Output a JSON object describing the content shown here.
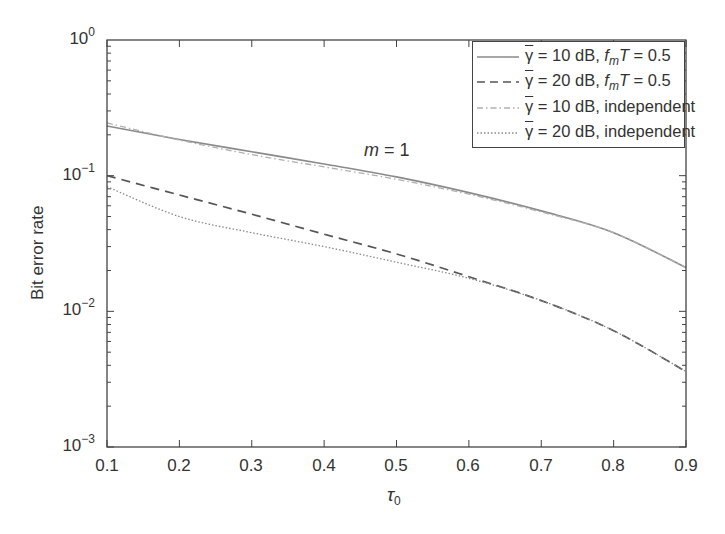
{
  "chart_data": {
    "type": "line",
    "title": "",
    "xlabel": "τ0",
    "ylabel": "Bit error rate",
    "xlim": [
      0.1,
      0.9
    ],
    "ylim": [
      0.001,
      1
    ],
    "yscale": "log",
    "grid": false,
    "legend_position": "upper right",
    "x_ticks": [
      "0.1",
      "0.2",
      "0.3",
      "0.4",
      "0.5",
      "0.6",
      "0.7",
      "0.8",
      "0.9"
    ],
    "y_ticks": [
      {
        "base": "10",
        "exp": "0"
      },
      {
        "base": "10",
        "exp": "−1"
      },
      {
        "base": "10",
        "exp": "−2"
      },
      {
        "base": "10",
        "exp": "−3"
      }
    ],
    "annotation": {
      "text": "m = 1",
      "x": 0.4,
      "y": 0.11
    },
    "x": [
      0.1,
      0.2,
      0.3,
      0.4,
      0.5,
      0.6,
      0.7,
      0.8,
      0.9
    ],
    "series": [
      {
        "name": "γ̄ = 10 dB, fmT = 0.5",
        "style": "solid",
        "color": "#8a8a8a",
        "values": [
          0.232,
          0.185,
          0.15,
          0.122,
          0.098,
          0.075,
          0.055,
          0.038,
          0.021
        ]
      },
      {
        "name": "γ̄ = 20 dB, fmT = 0.5",
        "style": "dashed",
        "color": "#555555",
        "values": [
          0.1,
          0.072,
          0.052,
          0.037,
          0.0265,
          0.018,
          0.012,
          0.0072,
          0.0036
        ]
      },
      {
        "name": "γ̄ = 10 dB, independent",
        "style": "dashdot",
        "color": "#b0b0b0",
        "values": [
          0.245,
          0.183,
          0.143,
          0.116,
          0.094,
          0.073,
          0.054,
          0.038,
          0.021
        ]
      },
      {
        "name": "γ̄ = 20 dB, independent",
        "style": "dotted",
        "color": "#8a8a8a",
        "values": [
          0.083,
          0.05,
          0.038,
          0.03,
          0.023,
          0.0175,
          0.012,
          0.0072,
          0.0036
        ]
      }
    ]
  },
  "legend": {
    "items": [
      {
        "prefix": "γ",
        "text": " = 10 dB, ",
        "f": "f",
        "sub": "m",
        "T": "T",
        "tail": " = 0.5"
      },
      {
        "prefix": "γ",
        "text": " = 20 dB, ",
        "f": "f",
        "sub": "m",
        "T": "T",
        "tail": " = 0.5"
      },
      {
        "prefix": "γ",
        "text": " = 10 dB, independent"
      },
      {
        "prefix": "γ",
        "text": " = 20 dB, independent"
      }
    ]
  },
  "annotation": {
    "m": "m",
    "eq": " = 1"
  },
  "axes": {
    "ylabel": "Bit error rate",
    "xlabel_main": "τ",
    "xlabel_sub": "0"
  }
}
